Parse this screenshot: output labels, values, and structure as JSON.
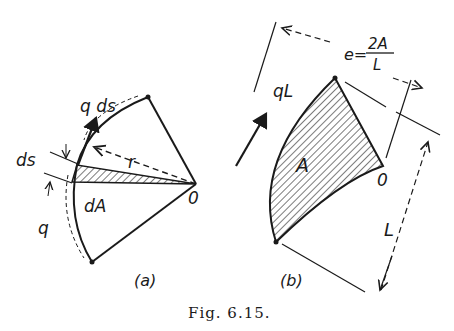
{
  "figure": {
    "caption": "Fig. 6.15.",
    "panel_a": {
      "label": "(a)",
      "labels": {
        "q_ds": "q ds",
        "ds": "ds",
        "r": "r",
        "dA": "dA",
        "origin": "0",
        "q": "q"
      }
    },
    "panel_b": {
      "label": "(b)",
      "labels": {
        "qL": "qL",
        "area": "A",
        "origin": "0",
        "e_lhs": "e=",
        "e_num": "2A",
        "e_den": "L",
        "L": "L"
      }
    }
  }
}
